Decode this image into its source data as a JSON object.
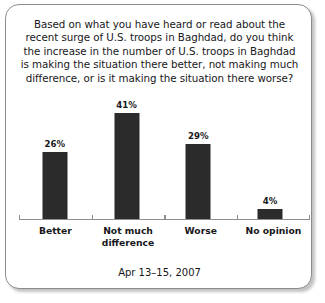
{
  "card": {
    "question": "Based on what you have heard or read about the recent surge of U.S. troops in Baghdad, do you think the increase in the number of U.S. troops in Baghdad is making the situation there better, not making much difference, or is it making the situation there worse?",
    "footer_date": "Apr 13–15, 2007"
  },
  "chart_data": {
    "type": "bar",
    "title": "Based on what you have heard or read about the recent surge of U.S. troops in Baghdad, do you think the increase in the number of U.S. troops in Baghdad is making the situation there better, not making much difference, or is it making the situation there worse?",
    "subtitle": "Apr 13–15, 2007",
    "categories": [
      "Better",
      "Not much difference",
      "Worse",
      "No opinion"
    ],
    "category_lines": [
      [
        "Better"
      ],
      [
        "Not much",
        "difference"
      ],
      [
        "Worse"
      ],
      [
        "No opinion"
      ]
    ],
    "values": [
      26,
      41,
      29,
      4
    ],
    "value_labels": [
      "26%",
      "41%",
      "29%",
      "4%"
    ],
    "xlabel": "",
    "ylabel": "",
    "ylim": [
      0,
      47
    ],
    "grid": false,
    "legend": false,
    "bar_color": "#2b2b2b",
    "axis_color": "#8e8e8e"
  }
}
